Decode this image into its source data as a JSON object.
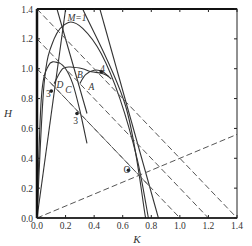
{
  "chart_data": {
    "type": "line",
    "title": "",
    "xlabel": "K",
    "ylabel": "H",
    "xlim": [
      0.0,
      1.4
    ],
    "ylim": [
      0.0,
      1.4
    ],
    "xticks": [
      "0.0",
      "0.2",
      "0.4",
      "0.6",
      "0.8",
      "1.0",
      "1.2",
      "1.4"
    ],
    "yticks": [
      "0.0",
      "0.2",
      "0.4",
      "0.6",
      "0.8",
      "1.0",
      "1.2",
      "1.4"
    ],
    "grid": false,
    "legend": null,
    "annotations": [
      {
        "text": "M=1",
        "x": 0.28,
        "y": 1.34
      },
      {
        "text": "4",
        "x": 0.46,
        "y": 1.0
      },
      {
        "text": "B",
        "x": 0.3,
        "y": 0.96
      },
      {
        "text": "A",
        "x": 0.38,
        "y": 0.88
      },
      {
        "text": "C",
        "x": 0.22,
        "y": 0.86
      },
      {
        "text": "D",
        "x": 0.16,
        "y": 0.89
      },
      {
        "text": "3",
        "x": 0.08,
        "y": 0.83
      },
      {
        "text": "3",
        "x": 0.27,
        "y": 0.65
      },
      {
        "text": "O",
        "x": 0.63,
        "y": 0.32
      }
    ],
    "series": [
      {
        "name": "M=1 curve",
        "style": "solid",
        "points": [
          [
            0.0,
            0.0
          ],
          [
            0.05,
            0.9
          ],
          [
            0.12,
            1.2
          ],
          [
            0.22,
            1.31
          ],
          [
            0.32,
            1.27
          ],
          [
            0.45,
            1.1
          ],
          [
            0.58,
            0.8
          ],
          [
            0.7,
            0.4
          ],
          [
            0.78,
            0.0
          ]
        ]
      },
      {
        "name": "inner curve D",
        "style": "solid",
        "points": [
          [
            0.0,
            0.0
          ],
          [
            0.03,
            0.8
          ],
          [
            0.08,
            1.02
          ],
          [
            0.15,
            1.04
          ],
          [
            0.2,
            1.0
          ],
          [
            0.25,
            0.9
          ],
          [
            0.3,
            0.72
          ],
          [
            0.35,
            0.5
          ]
        ]
      },
      {
        "name": "curve C/B",
        "style": "solid",
        "points": [
          [
            0.12,
            0.9
          ],
          [
            0.18,
            1.0
          ],
          [
            0.25,
            1.01
          ],
          [
            0.32,
            1.0
          ],
          [
            0.38,
            0.98
          ],
          [
            0.45,
            0.97
          ],
          [
            0.5,
            0.95
          ]
        ]
      },
      {
        "name": "curve A",
        "style": "solid",
        "points": [
          [
            0.3,
            0.9
          ],
          [
            0.34,
            0.96
          ],
          [
            0.4,
            0.99
          ],
          [
            0.46,
            0.98
          ],
          [
            0.52,
            0.93
          ]
        ]
      },
      {
        "name": "steep line 1",
        "style": "solid",
        "points": [
          [
            0.0,
            0.0
          ],
          [
            0.2,
            1.4
          ]
        ]
      },
      {
        "name": "steep line 2",
        "style": "solid",
        "points": [
          [
            0.14,
            1.4
          ],
          [
            0.35,
            0.7
          ]
        ]
      },
      {
        "name": "right line 1",
        "style": "solid",
        "points": [
          [
            0.32,
            1.4
          ],
          [
            0.62,
            0.75
          ],
          [
            0.76,
            0.0
          ]
        ]
      },
      {
        "name": "right line 2",
        "style": "solid",
        "points": [
          [
            0.44,
            1.4
          ],
          [
            0.85,
            0.0
          ]
        ]
      },
      {
        "name": "dashed diagonal from origin",
        "style": "dashed",
        "points": [
          [
            0.0,
            0.0
          ],
          [
            1.4,
            0.56
          ]
        ]
      },
      {
        "name": "dashed line to 1.4",
        "style": "dashed",
        "points": [
          [
            0.0,
            1.4
          ],
          [
            1.4,
            0.0
          ]
        ]
      },
      {
        "name": "dashed line to 1.2",
        "style": "dashed",
        "points": [
          [
            0.0,
            1.2
          ],
          [
            1.2,
            0.0
          ]
        ]
      },
      {
        "name": "dashed line to 1.0",
        "style": "dashed",
        "points": [
          [
            0.0,
            1.0
          ],
          [
            1.0,
            0.0
          ]
        ]
      },
      {
        "name": "dashed line to 0.8",
        "style": "dashed",
        "points": [
          [
            0.1,
            0.9
          ],
          [
            0.7,
            0.3
          ],
          [
            0.8,
            0.2
          ]
        ]
      }
    ],
    "special_points": [
      {
        "label": "O",
        "x": 0.64,
        "y": 0.32
      },
      {
        "label": "4",
        "x": 0.45,
        "y": 0.98
      },
      {
        "label": "3",
        "x": 0.1,
        "y": 0.85
      },
      {
        "label": "3",
        "x": 0.28,
        "y": 0.7
      }
    ]
  }
}
